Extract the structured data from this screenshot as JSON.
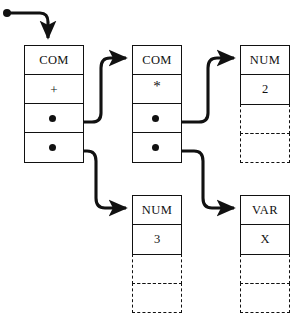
{
  "diagram": {
    "canvas": {
      "width": 302,
      "height": 326
    },
    "ink_color": "#111111",
    "background_color": "#ffffff"
  },
  "root_pointer": {
    "label": "root-pointer",
    "dot": {
      "x": 6,
      "y": 13,
      "r": 4
    },
    "target_node": "com-plus"
  },
  "nodes": [
    {
      "id": "com-plus",
      "name": "com-plus-node",
      "x": 24,
      "y": 45,
      "w": 60,
      "h": 118,
      "cells": [
        {
          "kind": "tag",
          "text": "COM"
        },
        {
          "kind": "op",
          "text": "+"
        },
        {
          "kind": "pointer",
          "text": "",
          "target": "com-times"
        },
        {
          "kind": "pointer",
          "text": "",
          "target": "num-3"
        }
      ]
    },
    {
      "id": "com-times",
      "name": "com-times-node",
      "x": 132,
      "y": 45,
      "w": 50,
      "h": 118,
      "cells": [
        {
          "kind": "tag",
          "text": "COM"
        },
        {
          "kind": "op-star",
          "text": "*"
        },
        {
          "kind": "pointer",
          "text": "",
          "target": "num-2"
        },
        {
          "kind": "pointer",
          "text": "",
          "target": "var-x"
        }
      ]
    },
    {
      "id": "num-2",
      "name": "num-2-node",
      "x": 240,
      "y": 45,
      "w": 50,
      "h": 118,
      "cells": [
        {
          "kind": "tag",
          "text": "NUM"
        },
        {
          "kind": "value",
          "text": "2"
        },
        {
          "kind": "dashed",
          "text": ""
        },
        {
          "kind": "dashed",
          "text": ""
        }
      ]
    },
    {
      "id": "num-3",
      "name": "num-3-node",
      "x": 132,
      "y": 195,
      "w": 50,
      "h": 118,
      "cells": [
        {
          "kind": "tag",
          "text": "NUM"
        },
        {
          "kind": "value",
          "text": "3"
        },
        {
          "kind": "dashed",
          "text": ""
        },
        {
          "kind": "dashed",
          "text": ""
        }
      ]
    },
    {
      "id": "var-x",
      "name": "var-x-node",
      "x": 240,
      "y": 195,
      "w": 50,
      "h": 118,
      "cells": [
        {
          "kind": "tag",
          "text": "VAR"
        },
        {
          "kind": "value",
          "text": "X"
        },
        {
          "kind": "dashed",
          "text": ""
        },
        {
          "kind": "dashed",
          "text": ""
        }
      ]
    }
  ],
  "edges": [
    {
      "name": "edge-root-to-com-plus",
      "from": "root-pointer",
      "to": "com-plus"
    },
    {
      "name": "edge-com-plus-to-com-times",
      "from": "com-plus.slot3",
      "to": "com-times"
    },
    {
      "name": "edge-com-plus-to-num-3",
      "from": "com-plus.slot4",
      "to": "num-3"
    },
    {
      "name": "edge-com-times-to-num-2",
      "from": "com-times.slot3",
      "to": "num-2"
    },
    {
      "name": "edge-com-times-to-var-x",
      "from": "com-times.slot4",
      "to": "var-x"
    }
  ]
}
